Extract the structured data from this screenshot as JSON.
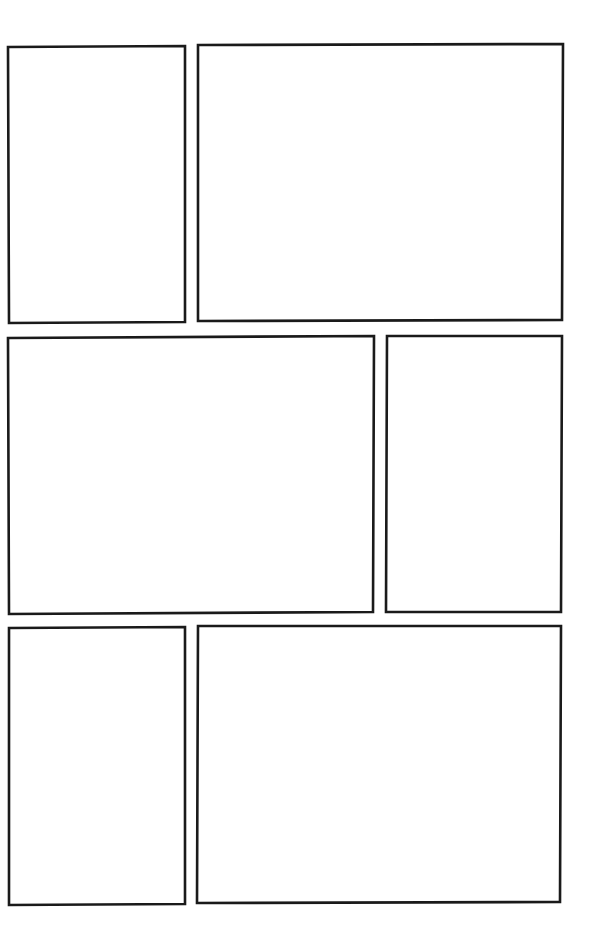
{
  "page": {
    "type": "comic-panel-template",
    "background": "#ffffff",
    "border_color": "#1a1a1a",
    "panel_count": 6
  },
  "panels": [
    {
      "id": 1,
      "row": 1,
      "points": "8,47 185,46 185,322 9,323"
    },
    {
      "id": 2,
      "row": 1,
      "points": "198,45 563,44 562,320 198,321"
    },
    {
      "id": 3,
      "row": 2,
      "points": "8,338 374,336 373,612 9,614"
    },
    {
      "id": 4,
      "row": 2,
      "points": "387,336 562,336 561,612 386,612"
    },
    {
      "id": 5,
      "row": 3,
      "points": "9,628 185,627 185,904 9,905"
    },
    {
      "id": 6,
      "row": 3,
      "points": "198,626 561,626 560,902 197,903"
    }
  ]
}
